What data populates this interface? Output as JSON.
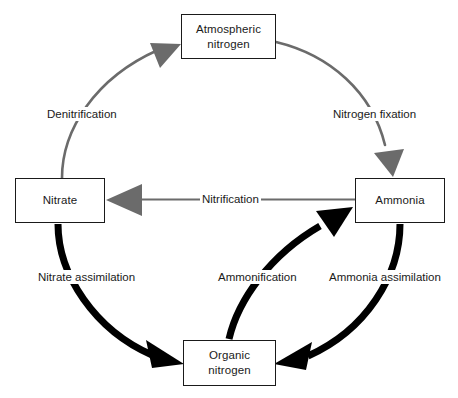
{
  "diagram": {
    "colors": {
      "gray_arrow": "#6b6b6b",
      "black_arrow": "#000000",
      "box_border": "#1a1a1a",
      "text": "#1a1a1a",
      "background": "#ffffff"
    },
    "nodes": [
      {
        "id": "atmospheric",
        "line1": "Atmospheric",
        "line2": "nitrogen"
      },
      {
        "id": "nitrate",
        "line1": "Nitrate",
        "line2": ""
      },
      {
        "id": "ammonia",
        "line1": "Ammonia",
        "line2": ""
      },
      {
        "id": "organic",
        "line1": "Organic",
        "line2": "nitrogen"
      }
    ],
    "edges": [
      {
        "id": "denitrification",
        "label": "Denitrification",
        "from": "nitrate",
        "to": "atmospheric",
        "style": "gray-curve"
      },
      {
        "id": "nitrogen_fixation",
        "label": "Nitrogen fixation",
        "from": "atmospheric",
        "to": "ammonia",
        "style": "gray-curve"
      },
      {
        "id": "nitrification",
        "label": "Nitrification",
        "from": "ammonia",
        "to": "nitrate",
        "style": "gray-straight"
      },
      {
        "id": "nitrate_assimilation",
        "label": "Nitrate assimilation",
        "from": "nitrate",
        "to": "organic",
        "style": "black-curve"
      },
      {
        "id": "ammonification",
        "label": "Ammonification",
        "from": "organic",
        "to": "ammonia",
        "style": "black-curve"
      },
      {
        "id": "ammonia_assimilation",
        "label": "Ammonia assimilation",
        "from": "ammonia",
        "to": "organic",
        "style": "black-curve"
      }
    ]
  }
}
